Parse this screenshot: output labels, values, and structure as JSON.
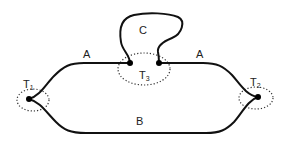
{
  "diagram": {
    "type": "graph",
    "colors": {
      "edge": "#111111",
      "node": "#000000",
      "region": "#333333",
      "label": "#222222"
    },
    "edges": [
      {
        "id": "A_left",
        "label": "A",
        "from": "T1",
        "to": "T3"
      },
      {
        "id": "A_right",
        "label": "A",
        "from": "T3",
        "to": "T2"
      },
      {
        "id": "B",
        "label": "B",
        "from": "T1",
        "to": "T2"
      },
      {
        "id": "C",
        "label": "C",
        "from": "T3",
        "to": "T3",
        "kind": "loop"
      }
    ],
    "labels": {
      "edge_a_left": "A",
      "edge_a_right": "A",
      "edge_b": "B",
      "edge_c": "C",
      "t1_main": "T",
      "t1_sub": "1",
      "t2_main": "T",
      "t2_sub": "2",
      "t3_main": "T",
      "t3_sub": "3"
    },
    "terminals": [
      {
        "name": "T1",
        "subscript": "1"
      },
      {
        "name": "T2",
        "subscript": "2"
      },
      {
        "name": "T3",
        "subscript": "3"
      }
    ]
  }
}
